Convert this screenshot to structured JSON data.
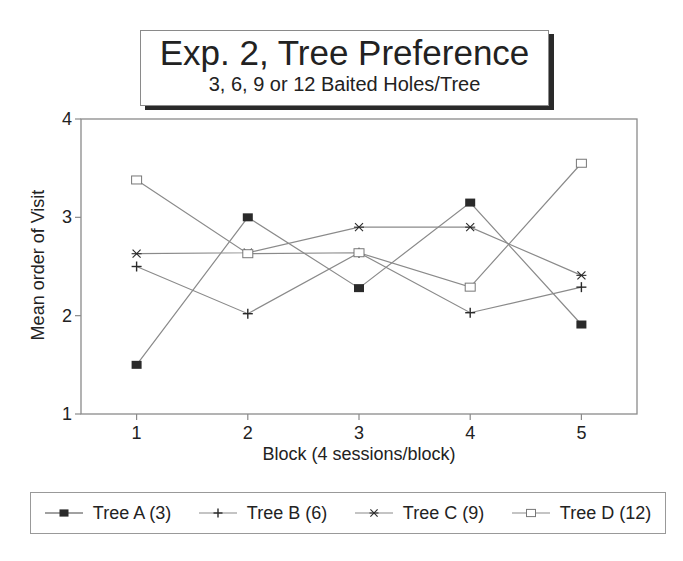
{
  "title": {
    "main": "Exp. 2, Tree Preference",
    "sub": "3, 6, 9 or 12 Baited Holes/Tree"
  },
  "axes": {
    "xlabel": "Block (4 sessions/block)",
    "ylabel": "Mean order of Visit",
    "xticks": [
      "1",
      "2",
      "3",
      "4",
      "5"
    ],
    "yticks": [
      "1",
      "2",
      "3",
      "4"
    ]
  },
  "legend": {
    "items": [
      {
        "label": "Tree A (3)",
        "marker": "filled-square"
      },
      {
        "label": "Tree B (6)",
        "marker": "plus"
      },
      {
        "label": "Tree C (9)",
        "marker": "asterisk"
      },
      {
        "label": "Tree D (12)",
        "marker": "open-square"
      }
    ]
  },
  "colors": {
    "line": "#8a8a8a",
    "marker": "#2a2a2a",
    "axis": "#8a8a8a"
  },
  "chart_data": {
    "type": "line",
    "title": "Exp. 2, Tree Preference",
    "subtitle": "3, 6, 9 or 12 Baited Holes/Tree",
    "xlabel": "Block (4 sessions/block)",
    "ylabel": "Mean order of Visit",
    "x": [
      1,
      2,
      3,
      4,
      5
    ],
    "xlim": [
      0.5,
      5.5
    ],
    "ylim": [
      1,
      4
    ],
    "yticks": [
      1,
      2,
      3,
      4
    ],
    "grid": false,
    "legend_position": "bottom",
    "series": [
      {
        "name": "Tree A (3)",
        "marker": "filled-square",
        "values": [
          1.5,
          3.0,
          2.28,
          3.15,
          1.91
        ]
      },
      {
        "name": "Tree B (6)",
        "marker": "plus",
        "values": [
          2.5,
          2.02,
          2.64,
          2.03,
          2.29
        ]
      },
      {
        "name": "Tree C (9)",
        "marker": "asterisk",
        "values": [
          2.63,
          2.64,
          2.9,
          2.9,
          2.41
        ]
      },
      {
        "name": "Tree D (12)",
        "marker": "open-square",
        "values": [
          3.38,
          2.63,
          2.64,
          2.29,
          3.55
        ]
      }
    ]
  }
}
